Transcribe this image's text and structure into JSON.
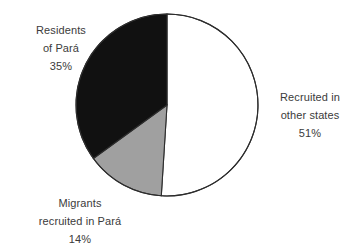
{
  "chart_data": {
    "type": "pie",
    "title": "",
    "subtitle": "",
    "xlabel": "",
    "ylabel": "",
    "legend_position": "none",
    "grid": false,
    "unit": "%",
    "start_angle_deg": 0,
    "direction": "clockwise",
    "categories": [
      "Recruited in other states",
      "Migrants recruited in Pará",
      "Residents of Pará"
    ],
    "values": [
      51,
      14,
      35
    ],
    "slices": [
      {
        "name": "recruited-other-states",
        "label_lines": [
          "Recruited in",
          "other states"
        ],
        "value": 51,
        "value_text": "51%",
        "color": "#ffffff",
        "stroke": "#2d2d2d",
        "start_deg": 0,
        "end_deg": 183.6
      },
      {
        "name": "migrants-recruited-in-para",
        "label_lines": [
          "Migrants",
          "recruited in Pará"
        ],
        "value": 14,
        "value_text": "14%",
        "color": "#a0a0a0",
        "stroke": "#2d2d2d",
        "start_deg": 183.6,
        "end_deg": 234.0
      },
      {
        "name": "residents-of-para",
        "label_lines": [
          "Residents",
          "of Pará"
        ],
        "value": 35,
        "value_text": "35%",
        "color": "#111111",
        "stroke": "#2d2d2d",
        "start_deg": 234.0,
        "end_deg": 360.0
      }
    ]
  },
  "labels": {
    "residents": {
      "line1": "Residents",
      "line2": "of Pará",
      "line3": "35%"
    },
    "recruited_other": {
      "line1": "Recruited in",
      "line2": "other states",
      "line3": "51%"
    },
    "migrants": {
      "line1": "Migrants",
      "line2": "recruited in Pará",
      "line3": "14%"
    }
  },
  "colors": {
    "slice_white": "#ffffff",
    "slice_gray": "#a0a0a0",
    "slice_black": "#111111",
    "outline": "#2d2d2d",
    "text": "#3b3b3b",
    "background": "#ffffff"
  }
}
